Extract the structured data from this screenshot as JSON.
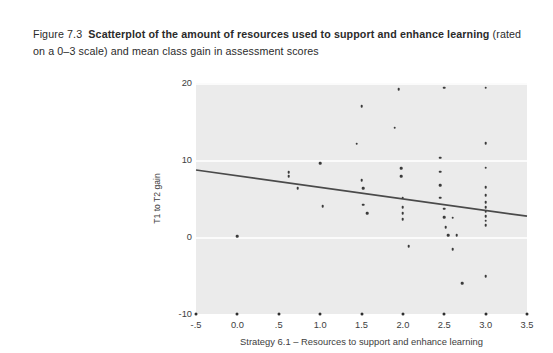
{
  "figure": {
    "number": "Figure 7.3",
    "title_bold": "Scatterplot of the amount of resources used to support and enhance learning",
    "title_rest": " (rated on a 0–3 scale) and mean class gain in assessment scores"
  },
  "chart_data": {
    "type": "scatter",
    "title": "",
    "xlabel": "Strategy 6.1 – Resources to support and enhance learning",
    "ylabel": "T1 to T2 gain",
    "xlim": [
      -0.5,
      3.5
    ],
    "ylim": [
      -10,
      20
    ],
    "xticks": [
      -0.5,
      0.0,
      0.5,
      1.0,
      1.5,
      2.0,
      2.5,
      3.0,
      3.5
    ],
    "xtick_labels": [
      "-.5",
      "0.0",
      ".5",
      "1.0",
      "1.5",
      "2.0",
      "2.5",
      "3.0",
      "3.5"
    ],
    "yticks": [
      -10,
      0,
      10,
      20
    ],
    "ytick_labels": [
      "-10",
      "0",
      "10",
      "20"
    ],
    "grid": "horizontal-white",
    "plot_background": "#ebebeb",
    "point_color": "#3a3a3a",
    "line_color": "#4a4a4a",
    "legend": null,
    "fit_line": {
      "type": "linear",
      "x_start": -0.5,
      "y_start": 8.7,
      "x_end": 3.5,
      "y_end": 2.7,
      "slope": -1.5,
      "intercept": 7.95
    },
    "points": [
      {
        "x": 0.0,
        "y": 0.1
      },
      {
        "x": 0.62,
        "y": 7.9
      },
      {
        "x": 0.62,
        "y": 8.4
      },
      {
        "x": 0.73,
        "y": 6.3
      },
      {
        "x": 1.0,
        "y": 9.6
      },
      {
        "x": 1.03,
        "y": 4.0
      },
      {
        "x": 1.5,
        "y": 17.0
      },
      {
        "x": 1.44,
        "y": 12.1
      },
      {
        "x": 1.5,
        "y": 7.4
      },
      {
        "x": 1.52,
        "y": 6.3
      },
      {
        "x": 1.52,
        "y": 4.2
      },
      {
        "x": 1.57,
        "y": 3.1
      },
      {
        "x": 1.95,
        "y": 19.2
      },
      {
        "x": 1.9,
        "y": 14.2
      },
      {
        "x": 1.98,
        "y": 8.9
      },
      {
        "x": 1.98,
        "y": 7.9
      },
      {
        "x": 2.0,
        "y": 5.1
      },
      {
        "x": 2.0,
        "y": 3.9
      },
      {
        "x": 2.0,
        "y": 3.1
      },
      {
        "x": 2.0,
        "y": 2.3
      },
      {
        "x": 2.07,
        "y": -1.2
      },
      {
        "x": 2.5,
        "y": 19.4
      },
      {
        "x": 2.45,
        "y": 10.3
      },
      {
        "x": 2.45,
        "y": 8.5
      },
      {
        "x": 2.45,
        "y": 6.7
      },
      {
        "x": 2.45,
        "y": 5.1
      },
      {
        "x": 2.5,
        "y": 3.7
      },
      {
        "x": 2.5,
        "y": 2.6
      },
      {
        "x": 2.52,
        "y": 1.3
      },
      {
        "x": 2.55,
        "y": 0.2
      },
      {
        "x": 2.6,
        "y": 2.5
      },
      {
        "x": 2.65,
        "y": 0.2
      },
      {
        "x": 3.0,
        "y": 19.4
      },
      {
        "x": 3.0,
        "y": 12.2
      },
      {
        "x": 3.0,
        "y": 9.0
      },
      {
        "x": 3.0,
        "y": 6.5
      },
      {
        "x": 3.0,
        "y": 5.4
      },
      {
        "x": 3.0,
        "y": 4.5
      },
      {
        "x": 3.0,
        "y": 3.9
      },
      {
        "x": 3.0,
        "y": 3.3
      },
      {
        "x": 3.0,
        "y": 2.7
      },
      {
        "x": 3.0,
        "y": 2.1
      },
      {
        "x": 3.0,
        "y": 1.5
      },
      {
        "x": 3.0,
        "y": -5.1
      },
      {
        "x": 2.72,
        "y": -6.0
      },
      {
        "x": 2.6,
        "y": -1.6
      }
    ]
  }
}
